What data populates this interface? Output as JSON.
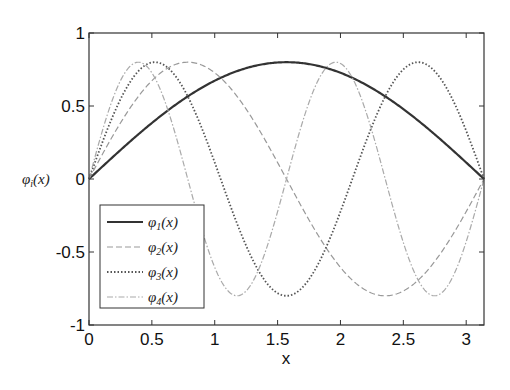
{
  "chart_data": {
    "type": "line",
    "title": "",
    "xlabel": "x",
    "ylabel": "φi(x)",
    "xlim": [
      0,
      3.1416
    ],
    "ylim": [
      -1,
      1
    ],
    "xticks": [
      "0",
      "0.5",
      "1",
      "1.5",
      "2",
      "2.5",
      "3"
    ],
    "yticks": [
      "-1",
      "-0.5",
      "0",
      "0.5",
      "1"
    ],
    "grid": false,
    "legend_position": "lower left",
    "series": [
      {
        "name": "φ1(x)",
        "formula": "0.8*sin(1*x)",
        "style": "solid",
        "color": "#333333"
      },
      {
        "name": "φ2(x)",
        "formula": "0.8*sin(2*x)",
        "style": "dashed",
        "color": "#999999"
      },
      {
        "name": "φ3(x)",
        "formula": "0.8*sin(3*x)",
        "style": "dotted",
        "color": "#555555"
      },
      {
        "name": "φ4(x)",
        "formula": "0.8*sin(4*x)",
        "style": "dashdot",
        "color": "#aaaaaa"
      }
    ],
    "amplitude": 0.8,
    "sample_points": {
      "x": [
        0,
        0.5236,
        1.0472,
        1.5708,
        2.0944,
        2.618,
        3.1416
      ],
      "phi1": [
        0,
        0.4,
        0.693,
        0.8,
        0.693,
        0.4,
        0
      ],
      "phi2": [
        0,
        0.693,
        0.693,
        0,
        -0.693,
        -0.693,
        0
      ],
      "phi3": [
        0,
        0.8,
        0,
        -0.8,
        0,
        0.8,
        0
      ],
      "phi4": [
        0,
        0.693,
        -0.693,
        0,
        0.693,
        -0.693,
        0
      ]
    }
  },
  "labels": {
    "xlabel": "x",
    "ylabel_base": "φ",
    "ylabel_sub": "i",
    "ylabel_arg": "(x)"
  },
  "legend": [
    {
      "base": "φ",
      "sub": "1",
      "arg": "(x)"
    },
    {
      "base": "φ",
      "sub": "2",
      "arg": "(x)"
    },
    {
      "base": "φ",
      "sub": "3",
      "arg": "(x)"
    },
    {
      "base": "φ",
      "sub": "4",
      "arg": "(x)"
    }
  ]
}
